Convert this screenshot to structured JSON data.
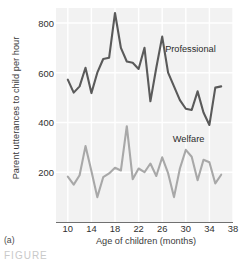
{
  "figure": {
    "panel_letter": "(a)",
    "partial_caption": "FIGURE"
  },
  "chart_data": {
    "type": "line",
    "title": "",
    "xlabel": "Age of children (months)",
    "ylabel": "Parent utterances to child per hour",
    "xlim": [
      8,
      38
    ],
    "ylim": [
      0,
      860
    ],
    "xticks": [
      10,
      14,
      18,
      22,
      26,
      30,
      34,
      38
    ],
    "yticks": [
      200,
      400,
      600,
      800
    ],
    "grid": true,
    "legend_position": "inline-annotation",
    "x": [
      10,
      11,
      12,
      13,
      14,
      15,
      16,
      17,
      18,
      19,
      20,
      21,
      22,
      23,
      24,
      25,
      26,
      27,
      28,
      29,
      30,
      31,
      32,
      33,
      34,
      35,
      36
    ],
    "series": [
      {
        "name": "Professional",
        "color": "#5a5a5a",
        "label_x": 26.5,
        "label_y": 690,
        "values": [
          572,
          520,
          545,
          620,
          518,
          600,
          655,
          660,
          840,
          700,
          645,
          640,
          615,
          700,
          485,
          620,
          745,
          600,
          545,
          490,
          455,
          450,
          525,
          440,
          390,
          540,
          545
        ]
      },
      {
        "name": "Welfare",
        "color": "#a8a8a8",
        "label_x": 27.8,
        "label_y": 330,
        "values": [
          182,
          150,
          188,
          305,
          205,
          100,
          180,
          195,
          218,
          207,
          385,
          172,
          215,
          200,
          235,
          185,
          260,
          196,
          100,
          215,
          290,
          262,
          168,
          250,
          240,
          155,
          190
        ]
      }
    ]
  }
}
